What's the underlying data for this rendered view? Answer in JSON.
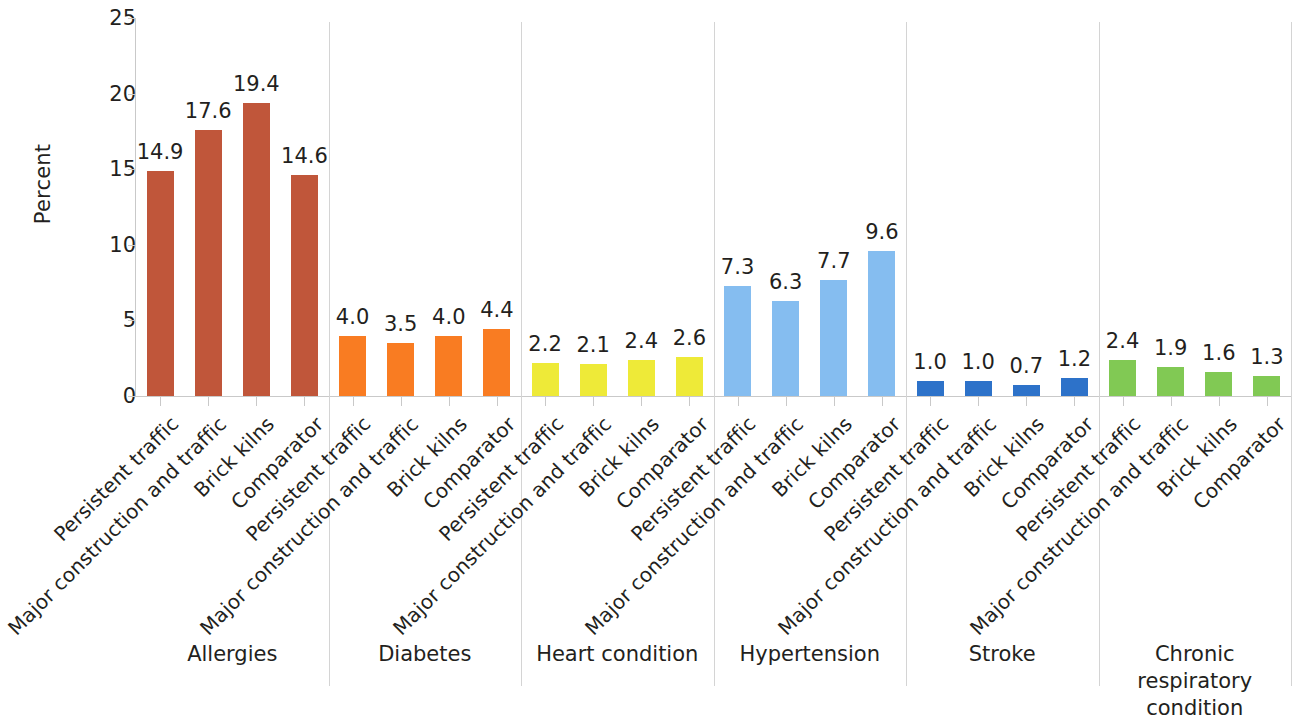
{
  "chart_data": {
    "type": "bar",
    "title": "",
    "xlabel": "",
    "ylabel": "Percent",
    "ylim": [
      0,
      25
    ],
    "y_ticks": [
      0,
      5,
      10,
      15,
      20,
      25
    ],
    "grid": false,
    "legend": "none",
    "categories": [
      "Persistent traffic",
      "Major construction and traffic",
      "Brick kilns",
      "Comparator"
    ],
    "groups": [
      {
        "name": "Allergies",
        "color": "#c0563a",
        "categories": [
          "Persistent traffic",
          "Major construction and traffic",
          "Brick kilns",
          "Comparator"
        ],
        "values": [
          14.9,
          17.6,
          19.4,
          14.6
        ],
        "value_labels": [
          "14.9",
          "17.6",
          "19.4",
          "14.6"
        ]
      },
      {
        "name": "Diabetes",
        "color": "#f97c22",
        "categories": [
          "Persistent traffic",
          "Major construction and traffic",
          "Brick kilns",
          "Comparator"
        ],
        "values": [
          4.0,
          3.5,
          4.0,
          4.4
        ],
        "value_labels": [
          "4.0",
          "3.5",
          "4.0",
          "4.4"
        ]
      },
      {
        "name": "Heart condition",
        "color": "#eeea38",
        "categories": [
          "Persistent traffic",
          "Major construction and traffic",
          "Brick kilns",
          "Comparator"
        ],
        "values": [
          2.2,
          2.1,
          2.4,
          2.6
        ],
        "value_labels": [
          "2.2",
          "2.1",
          "2.4",
          "2.6"
        ]
      },
      {
        "name": "Hypertension",
        "color": "#85bdf0",
        "categories": [
          "Persistent traffic",
          "Major construction and traffic",
          "Brick kilns",
          "Comparator"
        ],
        "values": [
          7.3,
          6.3,
          7.7,
          9.6
        ],
        "value_labels": [
          "7.3",
          "6.3",
          "7.7",
          "9.6"
        ]
      },
      {
        "name": "Stroke",
        "color": "#2d72c9",
        "categories": [
          "Persistent traffic",
          "Major construction and traffic",
          "Brick kilns",
          "Comparator"
        ],
        "values": [
          1.0,
          1.0,
          0.7,
          1.2
        ],
        "value_labels": [
          "1.0",
          "1.0",
          "0.7",
          "1.2"
        ]
      },
      {
        "name": "Chronic respiratory condition",
        "color": "#81c954",
        "categories": [
          "Persistent traffic",
          "Major construction and traffic",
          "Brick kilns",
          "Comparator"
        ],
        "values": [
          2.4,
          1.9,
          1.6,
          1.3
        ],
        "value_labels": [
          "2.4",
          "1.9",
          "1.6",
          "1.3"
        ]
      }
    ]
  },
  "axis": {
    "y_title": "Percent",
    "y_tick_labels": [
      "0",
      "5",
      "10",
      "15",
      "20",
      "25"
    ]
  },
  "colors": {
    "allergies": "#c0563a",
    "diabetes": "#f97c22",
    "heart_condition": "#eeea38",
    "hypertension": "#85bdf0",
    "stroke": "#2d72c9",
    "chronic_respiratory": "#81c954",
    "axis_line": "#c9c9c9",
    "separator": "#d4d4d4",
    "text": "#231f20"
  }
}
